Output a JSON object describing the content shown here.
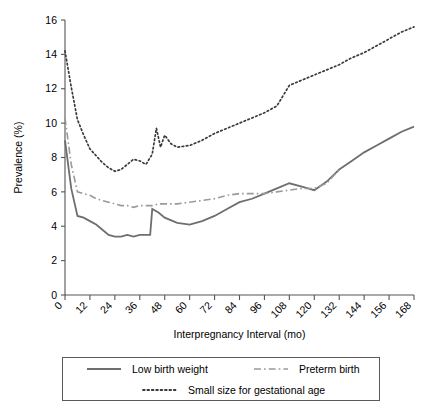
{
  "chart_data": {
    "type": "line",
    "title": "",
    "xlabel": "Interpregnancy Interval (mo)",
    "ylabel": "Prevalence (%)",
    "xlim": [
      0,
      168
    ],
    "ylim": [
      0,
      16
    ],
    "xticks": [
      0,
      12,
      24,
      36,
      48,
      60,
      72,
      84,
      96,
      108,
      120,
      132,
      144,
      156,
      168
    ],
    "yticks": [
      0,
      2,
      4,
      6,
      8,
      10,
      12,
      14,
      16
    ],
    "xtick_labels": [
      "0",
      "12",
      "24",
      "36",
      "48",
      "60",
      "72",
      "84",
      "96",
      "108",
      "120",
      "132",
      "144",
      "156",
      "168"
    ],
    "ytick_labels": [
      "0",
      "2",
      "4",
      "6",
      "8",
      "10",
      "12",
      "14",
      "16"
    ],
    "grid": false,
    "legend_position": "below-plot",
    "series": [
      {
        "name": "Low birth weight",
        "style": "solid",
        "color": "#6e6e6e",
        "x": [
          0,
          3,
          6,
          9,
          12,
          15,
          18,
          21,
          24,
          27,
          30,
          33,
          36,
          39,
          41,
          42,
          45,
          48,
          54,
          60,
          66,
          72,
          78,
          84,
          90,
          96,
          102,
          108,
          114,
          120,
          126,
          132,
          138,
          144,
          150,
          156,
          162,
          168
        ],
        "y": [
          9.0,
          6.2,
          4.6,
          4.5,
          4.3,
          4.1,
          3.8,
          3.5,
          3.4,
          3.4,
          3.5,
          3.4,
          3.5,
          3.5,
          3.5,
          5.0,
          4.8,
          4.5,
          4.2,
          4.1,
          4.3,
          4.6,
          5.0,
          5.4,
          5.6,
          5.9,
          6.2,
          6.5,
          6.3,
          6.1,
          6.6,
          7.3,
          7.8,
          8.3,
          8.7,
          9.1,
          9.5,
          9.8
        ]
      },
      {
        "name": "Preterm birth",
        "style": "dash-dot",
        "color": "#9a9a9a",
        "x": [
          0,
          3,
          6,
          9,
          12,
          15,
          18,
          21,
          24,
          27,
          30,
          33,
          36,
          39,
          42,
          45,
          48,
          54,
          60,
          66,
          72,
          78,
          84,
          90,
          96,
          102,
          108,
          114,
          120,
          126,
          132
        ],
        "y": [
          10.3,
          7.6,
          6.0,
          5.9,
          5.8,
          5.6,
          5.5,
          5.4,
          5.3,
          5.2,
          5.2,
          5.1,
          5.2,
          5.2,
          5.2,
          5.3,
          5.3,
          5.3,
          5.4,
          5.5,
          5.6,
          5.8,
          5.9,
          5.9,
          5.9,
          6.0,
          6.1,
          6.2,
          6.2,
          6.5,
          7.3
        ]
      },
      {
        "name": "Small size for gestational age",
        "style": "dotted",
        "color": "#3a3a3a",
        "x": [
          0,
          3,
          6,
          9,
          12,
          15,
          18,
          21,
          24,
          27,
          30,
          33,
          36,
          39,
          42,
          44,
          46,
          48,
          51,
          54,
          60,
          66,
          72,
          78,
          84,
          90,
          96,
          102,
          105,
          108,
          114,
          120,
          126,
          132,
          138,
          144,
          150,
          156,
          162,
          168
        ],
        "y": [
          14.2,
          12.1,
          10.2,
          9.3,
          8.5,
          8.1,
          7.7,
          7.4,
          7.2,
          7.3,
          7.6,
          7.9,
          7.8,
          7.6,
          8.2,
          9.7,
          8.6,
          9.3,
          8.8,
          8.6,
          8.7,
          9.0,
          9.4,
          9.7,
          10.0,
          10.3,
          10.6,
          11.0,
          11.6,
          12.2,
          12.5,
          12.8,
          13.1,
          13.4,
          13.8,
          14.1,
          14.5,
          14.9,
          15.3,
          15.6
        ]
      }
    ],
    "legend": [
      {
        "label": "Low birth weight",
        "style": "solid"
      },
      {
        "label": "Preterm birth",
        "style": "dash-dot"
      },
      {
        "label": "Small size for gestational age",
        "style": "dotted"
      }
    ]
  }
}
